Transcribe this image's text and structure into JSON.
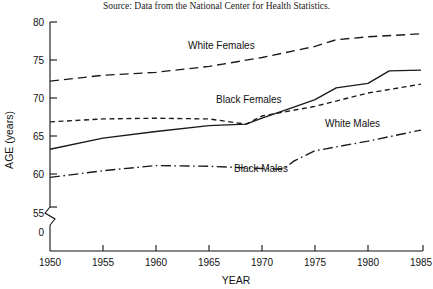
{
  "source_note": "Source: Data from the National Center for Health Statistics.",
  "axes": {
    "x_title": "YEAR",
    "y_title": "AGE (years)",
    "x_ticks": [
      "1950",
      "1955",
      "1960",
      "1965",
      "1970",
      "1975",
      "1980",
      "1985"
    ],
    "y_ticks": [
      "80",
      "75",
      "70",
      "65",
      "60",
      "55",
      "0"
    ],
    "break_label": "0"
  },
  "series_labels": {
    "white_females": "White Females",
    "black_females": "Black Females",
    "white_males": "White Males",
    "black_males": "Black Males"
  },
  "colors": {
    "line": "#1a1a1a",
    "axis": "#111111",
    "background": "#ffffff"
  },
  "chart_data": {
    "type": "line",
    "title": "",
    "subtitle": "",
    "xlabel": "YEAR",
    "ylabel": "AGE (years)",
    "xlim": [
      1950,
      1985
    ],
    "ylim": [
      55,
      80
    ],
    "y_axis_break": true,
    "y_break_from": 0,
    "y_break_to": 55,
    "grid": false,
    "legend_position": "inline-annotations",
    "x_ticks": [
      1950,
      1955,
      1960,
      1965,
      1970,
      1975,
      1980,
      1985
    ],
    "y_ticks": [
      55,
      60,
      65,
      70,
      75,
      80
    ],
    "series": [
      {
        "name": "White Females",
        "style": "long-dashed",
        "x": [
          1950,
          1955,
          1960,
          1965,
          1970,
          1975,
          1977,
          1980,
          1985
        ],
        "values": [
          72.0,
          72.8,
          73.2,
          74.0,
          75.2,
          76.7,
          77.6,
          78.0,
          78.4
        ]
      },
      {
        "name": "Black Females",
        "style": "solid",
        "x": [
          1950,
          1955,
          1960,
          1965,
          1968.5,
          1970,
          1973,
          1975,
          1977,
          1980,
          1982,
          1985
        ],
        "values": [
          62.8,
          64.3,
          65.2,
          66.0,
          66.2,
          67.0,
          68.5,
          69.5,
          71.1,
          71.7,
          73.4,
          73.5
        ]
      },
      {
        "name": "White Males",
        "style": "short-dashed",
        "x": [
          1950,
          1955,
          1960,
          1965,
          1968.5,
          1970,
          1975,
          1980,
          1985
        ],
        "values": [
          66.5,
          66.9,
          67.0,
          66.9,
          66.2,
          67.3,
          68.6,
          70.4,
          71.6
        ]
      },
      {
        "name": "Black Males",
        "style": "dash-dot",
        "x": [
          1950,
          1955,
          1960,
          1965,
          1970,
          1972,
          1973,
          1975,
          1980,
          1985
        ],
        "values": [
          59.0,
          59.9,
          60.6,
          60.5,
          60.2,
          60.1,
          61.2,
          62.6,
          63.9,
          65.4
        ]
      }
    ]
  }
}
